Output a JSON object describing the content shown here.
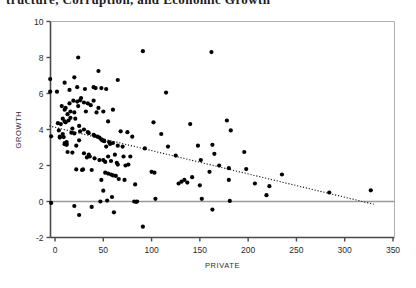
{
  "figure": {
    "clipped_title": "tructure, Corruption, and Economic Growth",
    "background_color": "#ffffff",
    "point_color": "#000000",
    "axis_color": "#4a4a4a",
    "zero_line_color": "#9a9a9a",
    "trend_line_color": "#1a1a1a"
  },
  "chart_data": {
    "type": "scatter",
    "title": "",
    "xlabel": "PRIVATE",
    "ylabel": "GROWTH",
    "xlim": [
      -12,
      352
    ],
    "ylim": [
      -2,
      10
    ],
    "xticks": [
      0,
      50,
      100,
      150,
      200,
      250,
      300,
      350
    ],
    "yticks": [
      -2,
      0,
      2,
      4,
      6,
      8,
      10
    ],
    "xtick_labels": [
      "0",
      "50",
      "100",
      "150",
      "200",
      "250",
      "300",
      "350"
    ],
    "ytick_labels": [
      "-2",
      "0",
      "2",
      "4",
      "6",
      "8",
      "10"
    ],
    "grid": false,
    "legend": null,
    "zero_line": {
      "y": 0,
      "from_x": -12,
      "to_x": 352
    },
    "trend_line": {
      "style": "dotted",
      "x0": -6,
      "y0": 4.2,
      "x1": 330,
      "y1": -0.15,
      "slope": -0.01295,
      "intercept": 4.122
    },
    "points": [
      [
        -5,
        6.8
      ],
      [
        -5,
        6.1
      ],
      [
        -4,
        3.62
      ],
      [
        -4,
        -0.08
      ],
      [
        2,
        6.1
      ],
      [
        3,
        4.35
      ],
      [
        4,
        3.95
      ],
      [
        5,
        3.6
      ],
      [
        5,
        3.55
      ],
      [
        6,
        4.3
      ],
      [
        7,
        5.3
      ],
      [
        8,
        4.6
      ],
      [
        8,
        3.75
      ],
      [
        9,
        3.58
      ],
      [
        10,
        6.6
      ],
      [
        10,
        5.1
      ],
      [
        10,
        4.45
      ],
      [
        10,
        3.25
      ],
      [
        10,
        3.18
      ],
      [
        11,
        5.2
      ],
      [
        11,
        4.4
      ],
      [
        12,
        3.3
      ],
      [
        12,
        3.2
      ],
      [
        12,
        3.15
      ],
      [
        13,
        4.85
      ],
      [
        13,
        2.75
      ],
      [
        14,
        4.5
      ],
      [
        15,
        6.2
      ],
      [
        15,
        5.45
      ],
      [
        16,
        5.0
      ],
      [
        16,
        4.65
      ],
      [
        17,
        3.82
      ],
      [
        18,
        4.05
      ],
      [
        18,
        2.72
      ],
      [
        19,
        5.6
      ],
      [
        20,
        6.9
      ],
      [
        20,
        4.95
      ],
      [
        20,
        3.78
      ],
      [
        20,
        -0.25
      ],
      [
        21,
        4.6
      ],
      [
        22,
        3.1
      ],
      [
        22,
        1.78
      ],
      [
        23,
        6.35
      ],
      [
        23,
        5.55
      ],
      [
        24,
        8.0
      ],
      [
        24,
        5.3
      ],
      [
        25,
        4.2
      ],
      [
        25,
        3.4
      ],
      [
        25,
        -0.75
      ],
      [
        26,
        5.62
      ],
      [
        26,
        3.9
      ],
      [
        27,
        5.75
      ],
      [
        28,
        1.75
      ],
      [
        29,
        1.78
      ],
      [
        30,
        5.5
      ],
      [
        30,
        4.0
      ],
      [
        30,
        2.68
      ],
      [
        31,
        6.25
      ],
      [
        32,
        5.0
      ],
      [
        33,
        2.45
      ],
      [
        34,
        5.45
      ],
      [
        34,
        3.85
      ],
      [
        35,
        3.8
      ],
      [
        35,
        2.6
      ],
      [
        36,
        2.5
      ],
      [
        37,
        5.35
      ],
      [
        38,
        1.75
      ],
      [
        38,
        -0.3
      ],
      [
        40,
        6.35
      ],
      [
        40,
        5.6
      ],
      [
        40,
        3.7
      ],
      [
        41,
        3.65
      ],
      [
        41,
        2.4
      ],
      [
        42,
        6.3
      ],
      [
        43,
        4.95
      ],
      [
        44,
        3.6
      ],
      [
        45,
        7.25
      ],
      [
        45,
        5.2
      ],
      [
        46,
        3.55
      ],
      [
        46,
        2.3
      ],
      [
        47,
        0.0
      ],
      [
        48,
        6.3
      ],
      [
        48,
        3.45
      ],
      [
        48,
        1.2
      ],
      [
        49,
        3.4
      ],
      [
        50,
        5.0
      ],
      [
        50,
        3.4
      ],
      [
        50,
        2.3
      ],
      [
        50,
        0.6
      ],
      [
        51,
        3.35
      ],
      [
        52,
        2.2
      ],
      [
        52,
        1.6
      ],
      [
        53,
        6.25
      ],
      [
        53,
        3.05
      ],
      [
        54,
        0.05
      ],
      [
        55,
        4.45
      ],
      [
        55,
        2.5
      ],
      [
        55,
        1.55
      ],
      [
        56,
        3.3
      ],
      [
        57,
        3.2
      ],
      [
        58,
        2.25
      ],
      [
        58,
        1.5
      ],
      [
        59,
        0.25
      ],
      [
        60,
        5.1
      ],
      [
        60,
        3.25
      ],
      [
        60,
        1.45
      ],
      [
        61,
        -0.6
      ],
      [
        62,
        2.6
      ],
      [
        63,
        1.42
      ],
      [
        64,
        2.15
      ],
      [
        65,
        6.75
      ],
      [
        65,
        3.1
      ],
      [
        65,
        2.05
      ],
      [
        66,
        1.25
      ],
      [
        68,
        3.9
      ],
      [
        70,
        3.05
      ],
      [
        71,
        2.5
      ],
      [
        72,
        1.2
      ],
      [
        73,
        2.0
      ],
      [
        75,
        3.85
      ],
      [
        76,
        2.05
      ],
      [
        78,
        2.5
      ],
      [
        80,
        3.6
      ],
      [
        82,
        0.0
      ],
      [
        83,
        0.95
      ],
      [
        84,
        -0.02
      ],
      [
        85,
        0.0
      ],
      [
        91,
        8.35
      ],
      [
        91,
        -1.4
      ],
      [
        93,
        2.95
      ],
      [
        100,
        1.65
      ],
      [
        102,
        4.4
      ],
      [
        103,
        1.6
      ],
      [
        104,
        0.15
      ],
      [
        110,
        3.75
      ],
      [
        115,
        6.05
      ],
      [
        117,
        3.05
      ],
      [
        125,
        2.55
      ],
      [
        128,
        1.0
      ],
      [
        131,
        1.1
      ],
      [
        134,
        1.2
      ],
      [
        137,
        1.05
      ],
      [
        140,
        4.3
      ],
      [
        142,
        1.35
      ],
      [
        148,
        3.1
      ],
      [
        150,
        0.9
      ],
      [
        151,
        2.3
      ],
      [
        152,
        0.15
      ],
      [
        160,
        1.65
      ],
      [
        162,
        8.3
      ],
      [
        163,
        3.15
      ],
      [
        163,
        -0.45
      ],
      [
        165,
        2.65
      ],
      [
        170,
        2.0
      ],
      [
        178,
        4.5
      ],
      [
        180,
        1.85
      ],
      [
        180,
        1.2
      ],
      [
        181,
        0.03
      ],
      [
        182,
        3.95
      ],
      [
        196,
        2.75
      ],
      [
        198,
        1.8
      ],
      [
        207,
        1.0
      ],
      [
        219,
        0.35
      ],
      [
        222,
        0.85
      ],
      [
        235,
        1.5
      ],
      [
        284,
        0.5
      ],
      [
        327,
        0.62
      ]
    ]
  }
}
